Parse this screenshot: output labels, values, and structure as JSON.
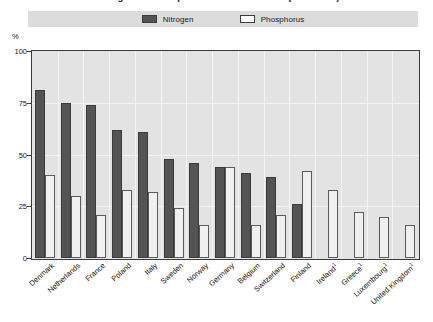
{
  "title": "Sewage treatment plants: nutrient removal (late 1990s)",
  "legend": {
    "position": "top-center",
    "entries": [
      {
        "label": "Nitrogen",
        "color": "#545454",
        "name": "nitrogen"
      },
      {
        "label": "Phosphorus",
        "color": "#ffffff",
        "name": "phosphorus"
      }
    ]
  },
  "axis": {
    "y_unit": "%",
    "y_ticks": [
      "0",
      "25",
      "50",
      "75",
      "100"
    ]
  },
  "colors": {
    "nitrogen_fill": "#545454",
    "phosphorus_fill": "#f0f0f0",
    "plot_background": "#e3e3e3",
    "legend_background": "#dcdcdc",
    "axis": "#3a3a3a",
    "gridline": "#f4f4f4"
  },
  "chart_data": {
    "type": "bar",
    "title": "Sewage treatment plants: nutrient removal (late 1990s)",
    "xlabel": "",
    "ylabel": "%",
    "ylim": [
      0,
      100
    ],
    "yticks": [
      0,
      25,
      50,
      75,
      100
    ],
    "grid": true,
    "legend_position": "top-center",
    "categories": [
      "Denmark",
      "Netherlands",
      "France",
      "Poland",
      "Italy",
      "Sweden",
      "Norway",
      "Germany",
      "Belgium",
      "Switzerland",
      "Finland",
      "Ireland ¹",
      "Greece ¹",
      "Luxembourg ¹",
      "United Kingdom ¹"
    ],
    "category_footnotes": {
      "Ireland ¹": "1",
      "Greece ¹": "1",
      "Luxembourg ¹": "1",
      "United Kingdom ¹": "1"
    },
    "series": [
      {
        "name": "Nitrogen",
        "color": "#545454",
        "values": [
          81,
          75,
          74,
          62,
          61,
          48,
          46,
          44,
          41,
          39,
          26,
          null,
          null,
          null,
          null
        ]
      },
      {
        "name": "Phosphorus",
        "color": "#ffffff",
        "values": [
          40,
          30,
          21,
          33,
          32,
          24,
          16,
          44,
          16,
          21,
          42,
          33,
          22,
          20,
          16
        ]
      }
    ]
  }
}
